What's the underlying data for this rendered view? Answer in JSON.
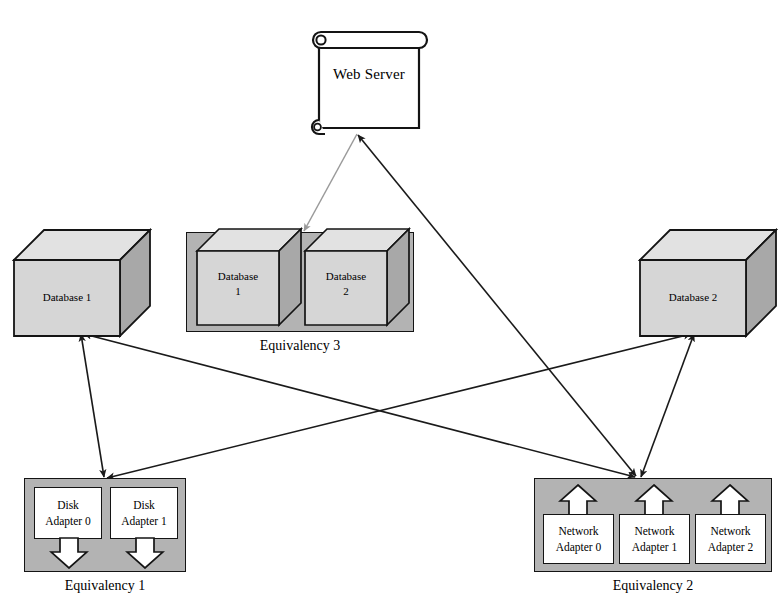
{
  "diagram": {
    "background": "#ffffff",
    "colors": {
      "panel_gray": "#b3b3b3",
      "cube_face": "#d6d6d6",
      "cube_top": "#e2e2e2",
      "cube_side": "#a8a8a8",
      "stroke": "#141414",
      "edge_dark": "#1a1a1a",
      "edge_light": "#9a9a9a",
      "white": "#ffffff"
    }
  },
  "nodes": {
    "web_server": {
      "label": "Web Server",
      "shape": "scroll-document-icon"
    },
    "database_1": {
      "label": "Database 1",
      "shape": "cube"
    },
    "database_2": {
      "label": "Database 2",
      "shape": "cube"
    },
    "eq3_db1": {
      "label": "Database\n1",
      "shape": "cube"
    },
    "eq3_db2": {
      "label": "Database\n2",
      "shape": "cube"
    }
  },
  "equivalencies": [
    {
      "id": "equivalency-1",
      "caption": "Equivalency 1",
      "arrow_direction": "down",
      "members": [
        {
          "line1": "Disk",
          "line2": "Adapter 0"
        },
        {
          "line1": "Disk",
          "line2": "Adapter 1"
        }
      ]
    },
    {
      "id": "equivalency-2",
      "caption": "Equivalency 2",
      "arrow_direction": "up",
      "members": [
        {
          "line1": "Network",
          "line2": "Adapter 0"
        },
        {
          "line1": "Network",
          "line2": "Adapter 1"
        },
        {
          "line1": "Network",
          "line2": "Adapter 2"
        }
      ]
    },
    {
      "id": "equivalency-3",
      "caption": "Equivalency 3",
      "arrow_direction": "none",
      "members": [
        {
          "line1": "Database",
          "line2": "1"
        },
        {
          "line1": "Database",
          "line2": "2"
        }
      ]
    }
  ],
  "edges": [
    {
      "id": "edge-webserver-to-equivalency3",
      "from": "web_server",
      "to": "equivalency-3",
      "style": "light-gray",
      "heads": "end"
    },
    {
      "id": "edge-webserver-to-equivalency2",
      "from": "web_server",
      "to": "equivalency-2",
      "style": "dark",
      "heads": "both"
    },
    {
      "id": "edge-database1-to-equivalency1",
      "from": "database_1",
      "to": "equivalency-1",
      "style": "dark",
      "heads": "both"
    },
    {
      "id": "edge-database1-to-equivalency2",
      "from": "database_1",
      "to": "equivalency-2",
      "style": "dark",
      "heads": "both"
    },
    {
      "id": "edge-database2-to-equivalency1",
      "from": "database_2",
      "to": "equivalency-1",
      "style": "dark",
      "heads": "both"
    },
    {
      "id": "edge-database2-to-equivalency2",
      "from": "database_2",
      "to": "equivalency-2",
      "style": "dark",
      "heads": "both"
    }
  ]
}
